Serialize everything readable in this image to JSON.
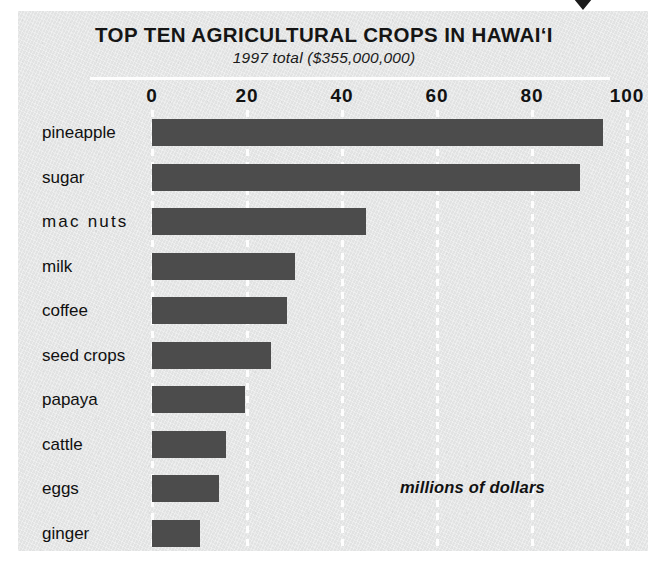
{
  "title": "TOP TEN AGRICULTURAL CROPS IN HAWAI‘I",
  "subtitle": "1997 total ($355,000,000)",
  "units_note": "millions of dollars",
  "colors": {
    "bar": "#4c4c4c",
    "background": "#e7e8e8",
    "gridline": "#fdfdfd",
    "text": "#111111"
  },
  "chart_data": {
    "type": "bar",
    "orientation": "horizontal",
    "title": "TOP TEN AGRICULTURAL CROPS IN HAWAI‘I",
    "subtitle": "1997 total ($355,000,000)",
    "xlabel": "millions of dollars",
    "ylabel": "",
    "xlim": [
      0,
      100
    ],
    "xticks": [
      "0",
      "20",
      "40",
      "60",
      "80",
      "100"
    ],
    "xtick_values": [
      0,
      20,
      40,
      60,
      80,
      100
    ],
    "grid": "vertical-dashed",
    "legend": "none",
    "categories": [
      "pineapple",
      "sugar",
      "mac nuts",
      "milk",
      "coffee",
      "seed crops",
      "papaya",
      "cattle",
      "eggs",
      "ginger"
    ],
    "values": [
      95,
      90,
      45,
      30,
      28.5,
      25,
      19.5,
      15.5,
      14,
      10
    ]
  },
  "rows": [
    {
      "label": "pineapple",
      "value": 95
    },
    {
      "label": "sugar",
      "value": 90
    },
    {
      "label": "mac  nuts",
      "value": 45
    },
    {
      "label": "milk",
      "value": 30
    },
    {
      "label": "coffee",
      "value": 28.5
    },
    {
      "label": "seed crops",
      "value": 25
    },
    {
      "label": "papaya",
      "value": 19.5
    },
    {
      "label": "cattle",
      "value": 15.5
    },
    {
      "label": "eggs",
      "value": 14
    },
    {
      "label": "ginger",
      "value": 10
    }
  ]
}
